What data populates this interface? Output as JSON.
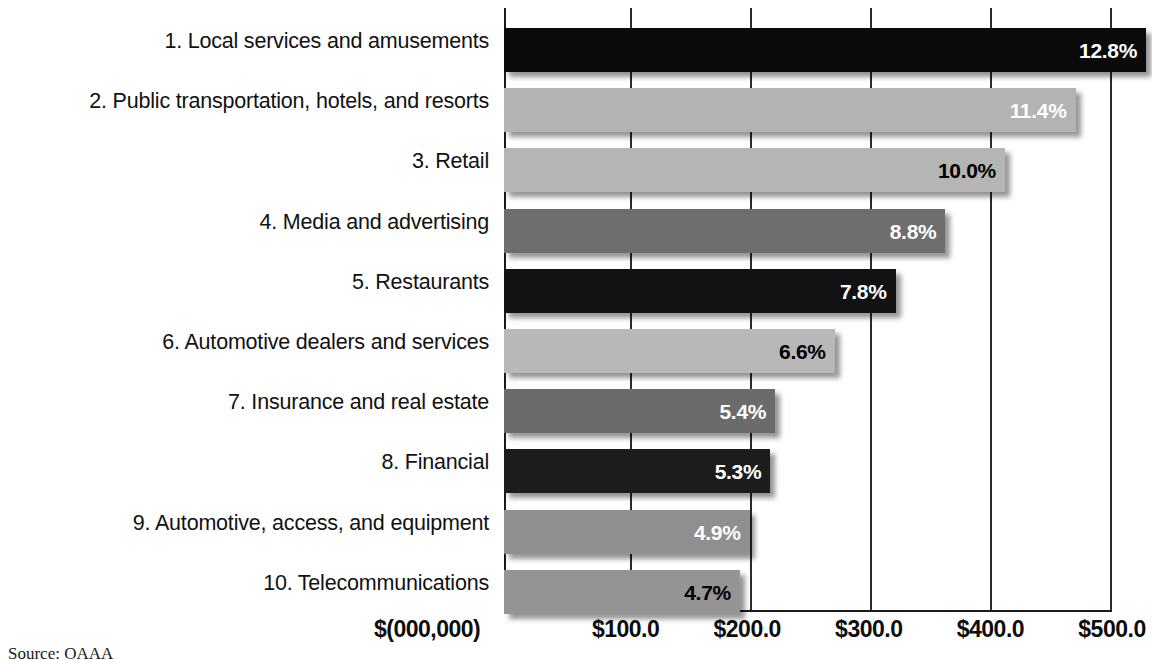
{
  "chart_data": {
    "type": "bar",
    "orientation": "horizontal",
    "title": "",
    "subtitle": "",
    "xlabel": "$(000,000)",
    "ylabel": "",
    "xlim": [
      0,
      500
    ],
    "grid": true,
    "legend": "none",
    "source_note": "Source: OAAA",
    "unit_label": "$(000,000)",
    "xticks": [
      {
        "label": "$100.0",
        "value": 100
      },
      {
        "label": "$200.0",
        "value": 200
      },
      {
        "label": "$300.0",
        "value": 300
      },
      {
        "label": "$400.0",
        "value": 400
      },
      {
        "label": "$500.0",
        "value": 500
      }
    ],
    "categories": [
      "1. Local services and amusements",
      "2. Public transportation, hotels, and resorts",
      "3. Retail",
      "4. Media and advertising",
      "5. Restaurants",
      "6. Automotive dealers and services",
      "7. Insurance and real estate",
      "8. Financial",
      "9. Automotive, access, and equipment",
      "10. Telecommunications"
    ],
    "values": [
      528,
      470,
      412,
      363,
      322,
      272,
      223,
      219,
      202,
      194
    ],
    "data_labels": [
      "12.8%",
      "11.4%",
      "10.0%",
      "8.8%",
      "7.8%",
      "6.6%",
      "5.4%",
      "5.3%",
      "4.9%",
      "4.7%"
    ],
    "percent_values": [
      12.8,
      11.4,
      10.0,
      8.8,
      7.8,
      6.6,
      5.4,
      5.3,
      4.9,
      4.7
    ],
    "bar_colors": [
      "#0a0a0a",
      "#b3b3b3",
      "#b5b5b5",
      "#6e6e6e",
      "#121212",
      "#b8b8b8",
      "#6b6b6b",
      "#1c1c1c",
      "#8f8f8f",
      "#949494"
    ],
    "label_text_colors": [
      "#ffffff",
      "#ffffff",
      "#000000",
      "#ffffff",
      "#ffffff",
      "#000000",
      "#ffffff",
      "#ffffff",
      "#ffffff",
      "#000000"
    ]
  },
  "bars": [
    {
      "category": "1. Local services and amusements",
      "label": "12.8%",
      "value": 528,
      "color": "#0a0a0a",
      "text_color": "#ffffff"
    },
    {
      "category": "2. Public transportation, hotels, and resorts",
      "label": "11.4%",
      "value": 470,
      "color": "#b3b3b3",
      "text_color": "#ffffff"
    },
    {
      "category": "3. Retail",
      "label": "10.0%",
      "value": 412,
      "color": "#b5b5b5",
      "text_color": "#000000"
    },
    {
      "category": "4. Media and advertising",
      "label": "8.8%",
      "value": 363,
      "color": "#6e6e6e",
      "text_color": "#ffffff"
    },
    {
      "category": "5. Restaurants",
      "label": "7.8%",
      "value": 322,
      "color": "#121212",
      "text_color": "#ffffff"
    },
    {
      "category": "6. Automotive dealers and services",
      "label": "6.6%",
      "value": 272,
      "color": "#b8b8b8",
      "text_color": "#000000"
    },
    {
      "category": "7. Insurance and real estate",
      "label": "5.4%",
      "value": 223,
      "color": "#6b6b6b",
      "text_color": "#ffffff"
    },
    {
      "category": "8. Financial",
      "label": "5.3%",
      "value": 219,
      "color": "#1c1c1c",
      "text_color": "#ffffff"
    },
    {
      "category": "9. Automotive, access, and equipment",
      "label": "4.9%",
      "value": 202,
      "color": "#8f8f8f",
      "text_color": "#ffffff"
    },
    {
      "category": "10. Telecommunications",
      "label": "4.7%",
      "value": 194,
      "color": "#949494",
      "text_color": "#000000"
    }
  ]
}
